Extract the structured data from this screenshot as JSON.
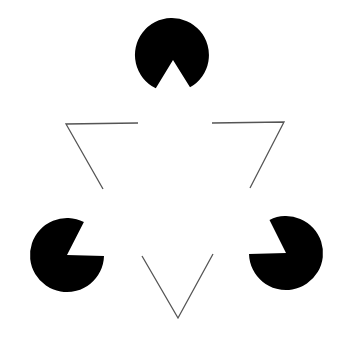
{
  "diagram": {
    "background": "#ffffff",
    "fill_color": "#000000",
    "line_color": "#555555",
    "pacmen": [
      {
        "name": "top",
        "cx": 172,
        "cy": 55,
        "r": 37,
        "mouth": [
          [
            155,
            90
          ],
          [
            173,
            60
          ],
          [
            191,
            89
          ]
        ]
      },
      {
        "name": "left",
        "cx": 67,
        "cy": 255,
        "r": 37,
        "mouth": [
          [
            84,
            222
          ],
          [
            67,
            255
          ],
          [
            104,
            256
          ]
        ]
      },
      {
        "name": "right",
        "cx": 286,
        "cy": 253,
        "r": 37,
        "mouth": [
          [
            269,
            219
          ],
          [
            286,
            253
          ],
          [
            249,
            254
          ]
        ]
      }
    ],
    "line_corners": [
      {
        "name": "left",
        "points": [
          [
            138,
            123
          ],
          [
            66,
            124
          ],
          [
            103,
            189
          ]
        ]
      },
      {
        "name": "right",
        "points": [
          [
            212,
            123
          ],
          [
            284,
            122
          ],
          [
            250,
            188
          ]
        ]
      },
      {
        "name": "bottom",
        "points": [
          [
            142,
            256
          ],
          [
            178,
            318
          ],
          [
            213,
            254
          ]
        ]
      }
    ]
  }
}
